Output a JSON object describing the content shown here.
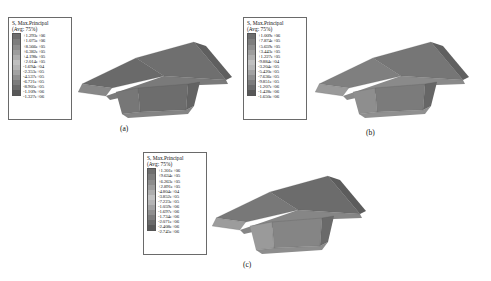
{
  "figure": {
    "type": "fea-stress-contour-figure",
    "variable_title": "S, Max.Principal",
    "average_label": "(Avg: 75%)"
  },
  "panels": [
    {
      "id": "a",
      "caption": "(a)",
      "legend": {
        "title": "S, Max.Principal",
        "subtitle": "(Avg: 75%)",
        "ticks": [
          "+1.293e+06",
          "+1.075e+06",
          "+8.566e+05",
          "+6.382e+05",
          "+4.198e+05",
          "+2.014e+05",
          "-1.694e+04",
          "-2.353e+05",
          "-4.537e+05",
          "-6.721e+05",
          "-8.905e+05",
          "-1.109e+06",
          "-1.327e+06"
        ],
        "colors": [
          "#6e6e6e",
          "#7d7d7d",
          "#8d8d8d",
          "#9d9d9d",
          "#aeaeae",
          "#c0c0c0",
          "#b5b5b5",
          "#a2a2a2",
          "#8f8f8f",
          "#7c7c7c",
          "#6a6a6a",
          "#585858"
        ]
      }
    },
    {
      "id": "b",
      "caption": "(b)",
      "legend": {
        "title": "S, Max.Principal",
        "subtitle": "(Avg: 75%)",
        "ticks": [
          "+1.009e+06",
          "+7.874e+05",
          "+5.659e+05",
          "+3.443e+05",
          "+1.227e+05",
          "-9.884e+04",
          "-3.204e+05",
          "-5.420e+05",
          "-7.636e+05",
          "-9.851e+05",
          "-1.207e+06",
          "-1.428e+06",
          "-1.650e+06"
        ],
        "colors": [
          "#6e6e6e",
          "#7d7d7d",
          "#8d8d8d",
          "#9d9d9d",
          "#aeaeae",
          "#c0c0c0",
          "#b5b5b5",
          "#a2a2a2",
          "#8f8f8f",
          "#7c7c7c",
          "#6a6a6a",
          "#585858"
        ]
      }
    },
    {
      "id": "c",
      "caption": "(c)",
      "legend": {
        "title": "S, Max.Principal",
        "subtitle": "(Avg: 75%)",
        "ticks": [
          "+1.301e+06",
          "+9.634e+05",
          "+6.263e+05",
          "+2.891e+05",
          "-4.804e+04",
          "-3.852e+05",
          "-7.223e+05",
          "-1.059e+06",
          "-1.697e+06",
          "-1.734e+06",
          "-2.071e+06",
          "-2.408e+06",
          "-2.745e+06"
        ],
        "colors": [
          "#6e6e6e",
          "#7d7d7d",
          "#8d8d8d",
          "#9d9d9d",
          "#aeaeae",
          "#c0c0c0",
          "#b5b5b5",
          "#a2a2a2",
          "#8f8f8f",
          "#7c7c7c",
          "#6a6a6a",
          "#585858"
        ]
      }
    }
  ]
}
